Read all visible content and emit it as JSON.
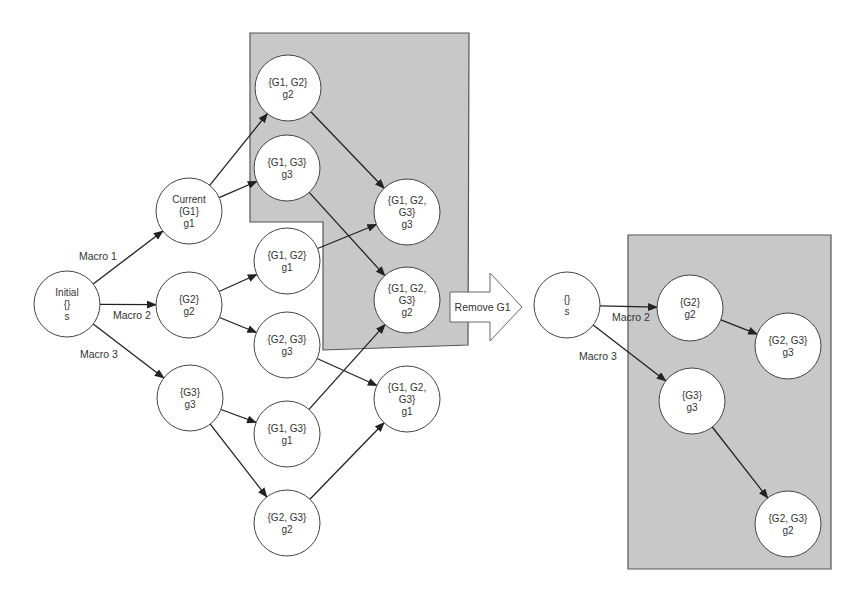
{
  "diagram": {
    "title": "",
    "colors": {
      "region_fill": "#c8c8c8",
      "region_stroke": "#555555",
      "node_fill": "#ffffff",
      "edge": "#222222"
    },
    "left_graph": {
      "nodes": [
        {
          "id": "initial",
          "lines": [
            "Initial",
            "{}",
            "s"
          ],
          "x": 67,
          "y": 304,
          "r": 33
        },
        {
          "id": "current_g1",
          "lines": [
            "Current",
            "{G1}",
            "g1"
          ],
          "x": 189,
          "y": 211,
          "r": 33
        },
        {
          "id": "g2",
          "lines": [
            "{G2}",
            "g2"
          ],
          "x": 189,
          "y": 305,
          "r": 33
        },
        {
          "id": "g3",
          "lines": [
            "{G3}",
            "g3"
          ],
          "x": 190,
          "y": 398,
          "r": 33
        },
        {
          "id": "g1g2_g2",
          "lines": [
            "{G1, G2}",
            "g2"
          ],
          "x": 288,
          "y": 88,
          "r": 33
        },
        {
          "id": "g1g3_g3",
          "lines": [
            "{G1, G3}",
            "g3"
          ],
          "x": 287,
          "y": 168,
          "r": 33
        },
        {
          "id": "g1g2_g1",
          "lines": [
            "{G1, G2}",
            "g1"
          ],
          "x": 287,
          "y": 261,
          "r": 33
        },
        {
          "id": "g2g3_g3",
          "lines": [
            "{G2, G3}",
            "g3"
          ],
          "x": 287,
          "y": 345,
          "r": 33
        },
        {
          "id": "g1g3_g1",
          "lines": [
            "{G1, G3}",
            "g1"
          ],
          "x": 287,
          "y": 434,
          "r": 33
        },
        {
          "id": "g2g3_g2",
          "lines": [
            "{G2, G3}",
            "g2"
          ],
          "x": 287,
          "y": 523,
          "r": 33
        },
        {
          "id": "g1g2g3_g3",
          "lines": [
            "{G1, G2,",
            "G3}",
            "g3"
          ],
          "x": 407,
          "y": 212,
          "r": 33
        },
        {
          "id": "g1g2g3_g2",
          "lines": [
            "{G1, G2,",
            "G3}",
            "g2"
          ],
          "x": 407,
          "y": 300,
          "r": 33
        },
        {
          "id": "g1g2g3_g1",
          "lines": [
            "{G1, G2,",
            "G3}",
            "g1"
          ],
          "x": 407,
          "y": 399,
          "r": 33
        }
      ],
      "edges": [
        {
          "from": "initial",
          "to": "current_g1",
          "label": "Macro 1"
        },
        {
          "from": "initial",
          "to": "g2",
          "label": "Macro 2"
        },
        {
          "from": "initial",
          "to": "g3",
          "label": "Macro 3"
        },
        {
          "from": "current_g1",
          "to": "g1g2_g2",
          "label": ""
        },
        {
          "from": "current_g1",
          "to": "g1g3_g3",
          "label": ""
        },
        {
          "from": "g2",
          "to": "g1g2_g1",
          "label": ""
        },
        {
          "from": "g2",
          "to": "g2g3_g3",
          "label": ""
        },
        {
          "from": "g3",
          "to": "g1g3_g1",
          "label": ""
        },
        {
          "from": "g3",
          "to": "g2g3_g2",
          "label": ""
        },
        {
          "from": "g1g2_g2",
          "to": "g1g2g3_g3",
          "label": ""
        },
        {
          "from": "g1g3_g3",
          "to": "g1g2g3_g2",
          "label": ""
        },
        {
          "from": "g1g2_g1",
          "to": "g1g2g3_g3",
          "label": ""
        },
        {
          "from": "g2g3_g3",
          "to": "g1g2g3_g1",
          "label": ""
        },
        {
          "from": "g1g3_g1",
          "to": "g1g2g3_g2",
          "label": ""
        },
        {
          "from": "g2g3_g2",
          "to": "g1g2g3_g1",
          "label": ""
        }
      ],
      "edge_labels": [
        {
          "text": "Macro 1",
          "x": 79,
          "y": 260
        },
        {
          "text": "Macro 2",
          "x": 113,
          "y": 319
        },
        {
          "text": "Macro 3",
          "x": 80,
          "y": 358
        }
      ],
      "region": {
        "points": "250,33 469,33 468,345 323,350 323,222 250,222"
      }
    },
    "transition": {
      "label": "Remove G1",
      "x": 450,
      "y": 273,
      "body_height": 30,
      "head_height": 68,
      "body_width": 40,
      "head_width": 32
    },
    "right_graph": {
      "nodes": [
        {
          "id": "r_s",
          "lines": [
            "{}",
            "s"
          ],
          "x": 567,
          "y": 305,
          "r": 33
        },
        {
          "id": "r_g2",
          "lines": [
            "{G2}",
            "g2"
          ],
          "x": 690,
          "y": 308,
          "r": 33
        },
        {
          "id": "r_g3",
          "lines": [
            "{G3}",
            "g3"
          ],
          "x": 692,
          "y": 401,
          "r": 33
        },
        {
          "id": "r_g2g3_g3",
          "lines": [
            "{G2, G3}",
            "g3"
          ],
          "x": 788,
          "y": 346,
          "r": 33
        },
        {
          "id": "r_g2g3_g2",
          "lines": [
            "{G2, G3}",
            "g2"
          ],
          "x": 788,
          "y": 524,
          "r": 33
        }
      ],
      "edges": [
        {
          "from": "r_s",
          "to": "r_g2",
          "label": "Macro 2"
        },
        {
          "from": "r_s",
          "to": "r_g3",
          "label": "Macro 3"
        },
        {
          "from": "r_g2",
          "to": "r_g2g3_g3",
          "label": ""
        },
        {
          "from": "r_g3",
          "to": "r_g2g3_g2",
          "label": ""
        }
      ],
      "edge_labels": [
        {
          "text": "Macro 2",
          "x": 612,
          "y": 321
        },
        {
          "text": "Macro 3",
          "x": 579,
          "y": 360
        }
      ],
      "region": {
        "points": "628,235 831,235 831,569 628,569"
      }
    }
  }
}
